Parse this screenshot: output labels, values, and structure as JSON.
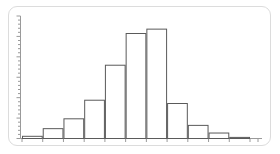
{
  "figure": {
    "kind": "histogram-figure",
    "background_color": "#ffffff",
    "frame_color": "#dcdcdc",
    "axis_color": "#9a9a9a",
    "bar_stroke_color": "#5a5a5a",
    "bar_fill_color": "#ffffff",
    "title": "",
    "caption": ""
  },
  "chart_data": {
    "type": "bar",
    "title": "",
    "subtitle": "",
    "xlabel": "",
    "ylabel": "",
    "categories": [
      "1",
      "2",
      "3",
      "4",
      "5",
      "6",
      "7",
      "8",
      "9",
      "10",
      "11"
    ],
    "values": [
      2,
      9,
      18,
      35,
      67,
      96,
      100,
      32,
      12,
      5,
      1
    ],
    "ylim": [
      0,
      112
    ],
    "xlim": [
      0,
      11
    ],
    "grid": false,
    "legend": null,
    "legend_position": "none",
    "annotations": [],
    "x_tick_labels": [],
    "y_tick_labels": [],
    "y_minor_tick_count": 30,
    "x_major_tick_count": 11
  },
  "axes": {
    "y_axis_name": "vertical-axis",
    "x_axis_name": "horizontal-axis",
    "y_ticks_visible": true,
    "x_ticks_visible": true,
    "tick_labels_visible": false
  }
}
